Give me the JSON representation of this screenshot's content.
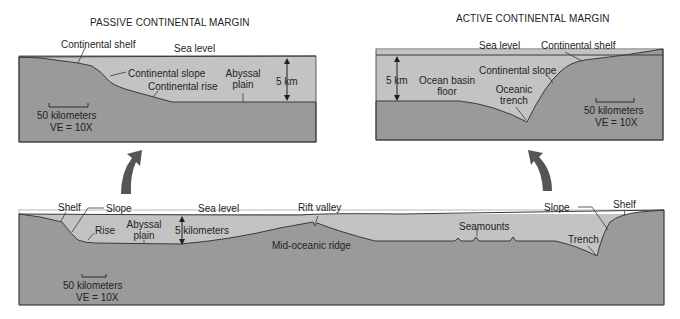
{
  "colors": {
    "water": "#c3c3c3",
    "crust": "#9a9a9a",
    "outline": "#3a3a3a",
    "arrow": "#555555",
    "text": "#231f20"
  },
  "passive": {
    "title": "PASSIVE CONTINENTAL MARGIN",
    "labels": {
      "shelf": "Continental shelf",
      "sea_level": "Sea level",
      "slope": "Continental slope",
      "abyssal_1": "Abyssal",
      "abyssal_2": "plain",
      "depth": "5 km",
      "rise": "Continental rise",
      "scale": "50 kilometers",
      "ve": "VE = 10X"
    }
  },
  "active": {
    "title": "ACTIVE CONTINENTAL MARGIN",
    "labels": {
      "sea_level": "Sea level",
      "shelf": "Continental shelf",
      "depth": "5 km",
      "basin_1": "Ocean basin",
      "basin_2": "floor",
      "slope": "Continental slope",
      "trench_1": "Oceanic",
      "trench_2": "trench",
      "scale": "50 kilometers",
      "ve": "VE = 10X"
    }
  },
  "profile": {
    "labels": {
      "shelf_left": "Shelf",
      "slope_left": "Slope",
      "rise": "Rise",
      "abyssal_1": "Abyssal",
      "abyssal_2": "plain",
      "depth": "5 kilometers",
      "sea_level": "Sea level",
      "rift": "Rift valley",
      "ridge": "Mid-oceanic ridge",
      "seamounts": "Seamounts",
      "slope_right": "Slope",
      "shelf_right": "Shelf",
      "trench": "Trench",
      "scale": "50 kilometers",
      "ve": "VE = 10X"
    }
  }
}
